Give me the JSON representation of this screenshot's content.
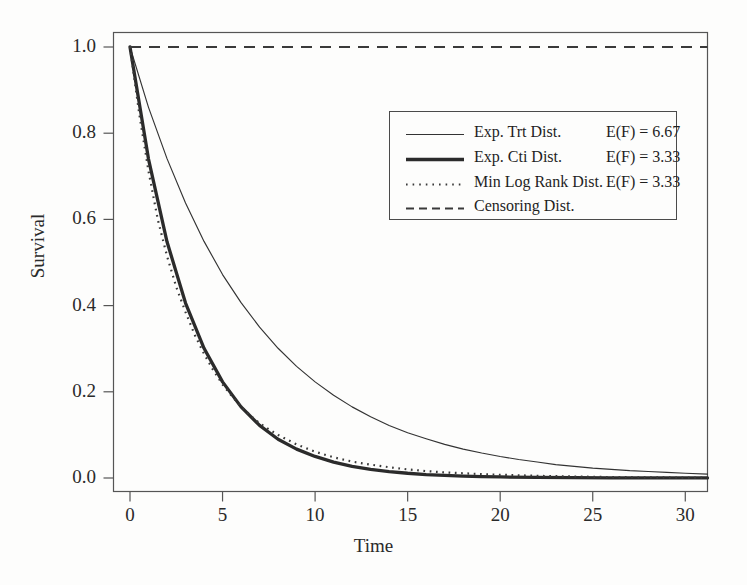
{
  "chart_data": {
    "type": "line",
    "title": "",
    "xlabel": "Time",
    "ylabel": "Survival",
    "xlim": [
      0,
      31.2
    ],
    "ylim": [
      0.0,
      1.0
    ],
    "xticks": [
      0,
      5,
      10,
      15,
      20,
      25,
      30
    ],
    "xtick_labels": [
      "0",
      "5",
      "10",
      "15",
      "20",
      "25",
      "30"
    ],
    "yticks": [
      0.0,
      0.2,
      0.4,
      0.6,
      0.8,
      1.0
    ],
    "ytick_labels": [
      "0.0",
      "0.2",
      "0.4",
      "0.6",
      "0.8",
      "1.0"
    ],
    "grid": false,
    "frame": true,
    "legend_position": "upper-right",
    "series": [
      {
        "name": "Exp. Trt Dist.",
        "annotation": "E(F) = 6.67",
        "mean": 6.67,
        "style": "solid-thin",
        "color": "#333333",
        "x": [
          0,
          1,
          2,
          3,
          4,
          5,
          6,
          7,
          8,
          9,
          10,
          11,
          12,
          13,
          14,
          15,
          16,
          17,
          18,
          19,
          20,
          21,
          22,
          23,
          24,
          25,
          26,
          27,
          28,
          29,
          30,
          31.2
        ],
        "y": [
          1.0,
          0.86,
          0.741,
          0.638,
          0.549,
          0.472,
          0.407,
          0.35,
          0.301,
          0.259,
          0.223,
          0.192,
          0.165,
          0.142,
          0.122,
          0.105,
          0.091,
          0.078,
          0.067,
          0.058,
          0.05,
          0.043,
          0.037,
          0.031,
          0.027,
          0.023,
          0.02,
          0.017,
          0.015,
          0.013,
          0.011,
          0.009
        ]
      },
      {
        "name": "Exp. Cti Dist.",
        "annotation": "E(F) = 3.33",
        "mean": 3.33,
        "style": "solid-thick",
        "color": "#2b2b2b",
        "x": [
          0,
          1,
          2,
          3,
          4,
          5,
          6,
          7,
          8,
          9,
          10,
          11,
          12,
          13,
          14,
          15,
          16,
          17,
          18,
          19,
          20,
          22,
          24,
          26,
          28,
          30,
          31.2
        ],
        "y": [
          1.0,
          0.74,
          0.548,
          0.406,
          0.301,
          0.223,
          0.165,
          0.122,
          0.09,
          0.067,
          0.05,
          0.037,
          0.027,
          0.02,
          0.015,
          0.011,
          0.008,
          0.006,
          0.0045,
          0.0033,
          0.0025,
          0.0013,
          0.0007,
          0.0004,
          0.0002,
          0.0001,
          0.0001
        ]
      },
      {
        "name": "Min Log Rank Dist.",
        "annotation": "E(F) = 3.33",
        "mean": 3.33,
        "style": "dotted",
        "color": "#3a3a3a",
        "x": [
          0,
          0.5,
          1,
          1.5,
          2,
          2.5,
          3,
          3.5,
          4,
          4.5,
          5,
          5.5,
          6,
          6.5,
          7,
          7.5,
          8,
          9,
          10,
          11,
          12,
          13,
          14,
          15,
          16,
          17,
          18,
          19,
          20,
          22,
          24,
          26,
          28,
          30,
          31.2
        ],
        "y": [
          1.0,
          0.845,
          0.712,
          0.6,
          0.515,
          0.443,
          0.385,
          0.332,
          0.288,
          0.25,
          0.217,
          0.19,
          0.166,
          0.145,
          0.127,
          0.113,
          0.1,
          0.078,
          0.061,
          0.048,
          0.038,
          0.031,
          0.025,
          0.02,
          0.016,
          0.013,
          0.011,
          0.009,
          0.0075,
          0.005,
          0.0034,
          0.0022,
          0.0015,
          0.001,
          0.0008
        ]
      },
      {
        "name": "Censoring Dist.",
        "annotation": "",
        "style": "dashed",
        "color": "#3a3a3a",
        "x": [
          0,
          31.2
        ],
        "y": [
          1.0,
          1.0
        ]
      }
    ]
  },
  "axes": {
    "x_title": "Time",
    "y_title": "Survival"
  },
  "legend": {
    "rows": [
      {
        "label": "Exp. Trt Dist.",
        "value": "E(F) = 6.67",
        "icon": "solid-thin-line-icon"
      },
      {
        "label": "Exp. Cti Dist.",
        "value": "E(F) = 3.33",
        "icon": "solid-thick-line-icon"
      },
      {
        "label": "Min Log Rank Dist.",
        "value": "E(F) = 3.33",
        "icon": "dotted-line-icon"
      },
      {
        "label": "Censoring Dist.",
        "value": "",
        "icon": "dashed-line-icon"
      }
    ]
  },
  "colors": {
    "background": "#fdfdfc",
    "frame": "#555555",
    "text": "#2a2a2a",
    "series_thin": "#333333",
    "series_thick": "#2b2b2b",
    "series_dotted": "#3a3a3a",
    "series_dashed": "#3a3a3a"
  }
}
